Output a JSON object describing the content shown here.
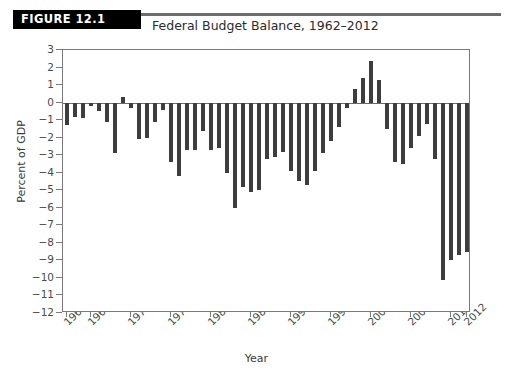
{
  "figure": {
    "badge_label": "FIGURE 12.1",
    "title": "Federal Budget Balance, 1962–2012"
  },
  "colors": {
    "bar": "#3d3d3d",
    "badge_background": "#000000",
    "badge_text": "#ffffff",
    "axis": "#7a7a7a",
    "rule": "#6d6d6d"
  },
  "chart_data": {
    "type": "bar",
    "title": "Federal Budget Balance, 1962–2012",
    "xlabel": "Year",
    "ylabel": "Percent of GDP",
    "ylim": [
      -12,
      3
    ],
    "ytick_labels": [
      "3",
      "2",
      "1",
      "0",
      "−1",
      "−2",
      "−3",
      "−4",
      "−5",
      "−6",
      "−7",
      "−8",
      "−9",
      "−10",
      "−11",
      "−12"
    ],
    "ytick_values": [
      3,
      2,
      1,
      0,
      -1,
      -2,
      -3,
      -4,
      -5,
      -6,
      -7,
      -8,
      -9,
      -10,
      -11,
      -12
    ],
    "xtick_labels": [
      "1962",
      "1965",
      "1970",
      "1975",
      "1980",
      "1985",
      "1990",
      "1995",
      "2000",
      "2005",
      "2010",
      "2012"
    ],
    "grid": false,
    "legend": null,
    "categories": [
      "1962",
      "1963",
      "1964",
      "1965",
      "1966",
      "1967",
      "1968",
      "1969",
      "1970",
      "1971",
      "1972",
      "1973",
      "1974",
      "1975",
      "1976",
      "1977",
      "1978",
      "1979",
      "1980",
      "1981",
      "1982",
      "1983",
      "1984",
      "1985",
      "1986",
      "1987",
      "1988",
      "1989",
      "1990",
      "1991",
      "1992",
      "1993",
      "1994",
      "1995",
      "1996",
      "1997",
      "1998",
      "1999",
      "2000",
      "2001",
      "2002",
      "2003",
      "2004",
      "2005",
      "2006",
      "2007",
      "2008",
      "2009",
      "2010",
      "2011",
      "2012"
    ],
    "values": [
      -1.3,
      -0.8,
      -0.9,
      -0.2,
      -0.5,
      -1.1,
      -2.9,
      0.3,
      -0.3,
      -2.1,
      -2.0,
      -1.1,
      -0.4,
      -3.4,
      -4.2,
      -2.7,
      -2.7,
      -1.6,
      -2.7,
      -2.6,
      -4.0,
      -6.0,
      -4.8,
      -5.1,
      -5.0,
      -3.2,
      -3.1,
      -2.8,
      -3.9,
      -4.5,
      -4.7,
      -3.9,
      -2.9,
      -2.2,
      -1.4,
      -0.3,
      0.8,
      1.4,
      2.4,
      1.3,
      -1.5,
      -3.4,
      -3.5,
      -2.6,
      -1.9,
      -1.2,
      -3.2,
      -10.1,
      -9.0,
      -8.7,
      -8.5
    ],
    "units": "percent of GDP",
    "notable": {
      "max_surplus_year": "2000",
      "max_surplus_value": 2.4,
      "max_deficit_year": "2009",
      "max_deficit_value": -10.1
    }
  }
}
